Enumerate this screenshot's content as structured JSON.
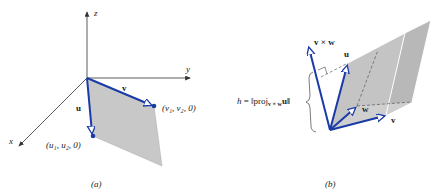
{
  "figure_a": {
    "axis_labels": {
      "x": "x",
      "y": "y",
      "z": "z"
    },
    "vector_u": "u",
    "vector_v": "v",
    "point_u": "(u₁, u₂, 0)",
    "point_v": "(v₁, v₂, 0)",
    "caption": "(a)"
  },
  "figure_b": {
    "vector_vxw": "v × w",
    "vector_u": "u",
    "vector_w": "w",
    "vector_v": "v",
    "height_label": "h = ‖proj",
    "height_sub": "v × w",
    "height_tail": "u‖",
    "caption": "(b)"
  },
  "colors": {
    "vector": "#1a3aa8",
    "axis": "#333333",
    "fill": "#c8c8c8"
  }
}
